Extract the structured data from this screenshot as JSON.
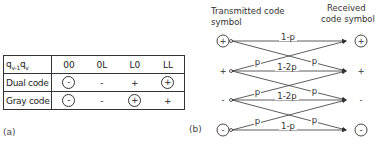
{
  "panel_a": {
    "caption": "(a)",
    "header": {
      "label": "q_{v-1} q_v",
      "label_main": "q",
      "sub1": "v-1",
      "label_main2": "q",
      "sub2": "v",
      "cols": [
        "00",
        "0L",
        "L0",
        "LL"
      ]
    },
    "rows": [
      {
        "label": "Dual code",
        "cells": [
          {
            "sym": "-",
            "circled": true
          },
          {
            "sym": "-",
            "circled": false
          },
          {
            "sym": "+",
            "circled": false
          },
          {
            "sym": "+",
            "circled": true
          }
        ]
      },
      {
        "label": "Gray code",
        "cells": [
          {
            "sym": "-",
            "circled": true
          },
          {
            "sym": "-",
            "circled": false
          },
          {
            "sym": "+",
            "circled": true
          },
          {
            "sym": "+",
            "circled": false
          }
        ]
      }
    ]
  },
  "panel_b": {
    "caption": "(b)",
    "left_title_1": "Transmitted code",
    "left_title_2": "symbol",
    "right_title_1": "Received",
    "right_title_2": "code symbol",
    "symbols": [
      {
        "sym": "+",
        "circled": true
      },
      {
        "sym": "+",
        "circled": false
      },
      {
        "sym": "-",
        "circled": false
      },
      {
        "sym": "-",
        "circled": true
      }
    ],
    "labels": {
      "top_straight": "1-p",
      "mid1_straight": "1-2p",
      "mid2_straight": "1-2p",
      "bottom_straight": "1-p",
      "p": "p"
    }
  }
}
